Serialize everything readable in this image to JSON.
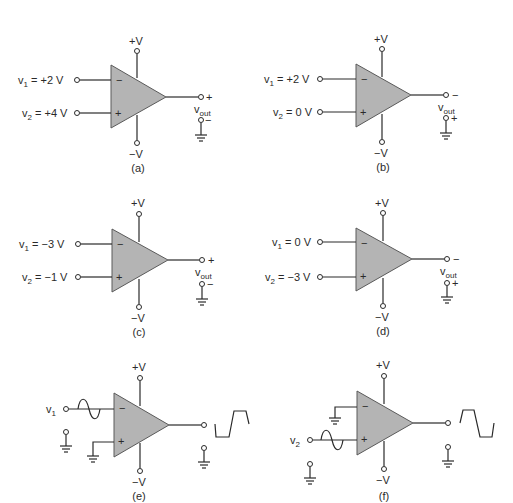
{
  "figure": {
    "supply_pos_label": "+V",
    "supply_neg_label": "−V",
    "inverting_sign": "−",
    "noninverting_sign": "+",
    "output_label": "v",
    "output_sub": "out"
  },
  "panels": [
    {
      "id": "a",
      "caption": "(a)",
      "v1_label": "v",
      "v1_sub": "1",
      "v1_value": " = +2 V",
      "v2_label": "v",
      "v2_sub": "2",
      "v2_value": " = +4 V",
      "out_top_sign": "+",
      "out_bot_sign": "−"
    },
    {
      "id": "b",
      "caption": "(b)",
      "v1_label": "v",
      "v1_sub": "1",
      "v1_value": " = +2 V",
      "v2_label": "v",
      "v2_sub": "2",
      "v2_value": " = 0 V",
      "out_top_sign": "−",
      "out_bot_sign": "+"
    },
    {
      "id": "c",
      "caption": "(c)",
      "v1_label": "v",
      "v1_sub": "1",
      "v1_value": " = −3 V",
      "v2_label": "v",
      "v2_sub": "2",
      "v2_value": " = −1 V",
      "out_top_sign": "+",
      "out_bot_sign": "−"
    },
    {
      "id": "d",
      "caption": "(d)",
      "v1_label": "v",
      "v1_sub": "1",
      "v1_value": " = 0 V",
      "v2_label": "v",
      "v2_sub": "2",
      "v2_value": " = −3 V",
      "out_top_sign": "−",
      "out_bot_sign": "+"
    },
    {
      "id": "e",
      "caption": "(e)",
      "input_label": "v",
      "input_sub": "1",
      "input_waveform": "sine",
      "output_waveform": "square"
    },
    {
      "id": "f",
      "caption": "(f)",
      "input_label": "v",
      "input_sub": "2",
      "input_waveform": "sine",
      "output_waveform": "square"
    }
  ]
}
